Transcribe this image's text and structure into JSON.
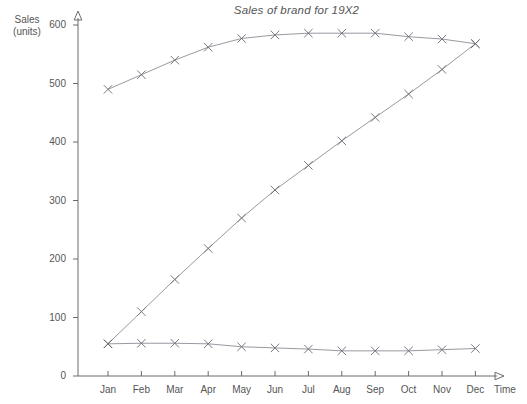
{
  "chart_data": {
    "type": "line",
    "title": "Sales of brand for 19X2",
    "xlabel": "Time",
    "ylabel": "Sales (units)",
    "ylabel_line1": "Sales",
    "ylabel_line2": "(units)",
    "categories": [
      "Jan",
      "Feb",
      "Mar",
      "Apr",
      "May",
      "Jun",
      "Jul",
      "Aug",
      "Sep",
      "Oct",
      "Nov",
      "Dec"
    ],
    "ylim": [
      0,
      600
    ],
    "yticks": [
      0,
      100,
      200,
      300,
      400,
      500,
      600
    ],
    "ytick_labels": [
      "0",
      "100",
      "200",
      "300",
      "400",
      "500",
      "600"
    ],
    "grid": false,
    "legend": "none",
    "marker": "x-cross",
    "series": [
      {
        "name": "Upper curve",
        "values": [
          490,
          515,
          540,
          562,
          577,
          583,
          586,
          586,
          586,
          580,
          576,
          568
        ]
      },
      {
        "name": "Rising curve",
        "values": [
          55,
          110,
          165,
          218,
          270,
          318,
          360,
          402,
          442,
          482,
          524,
          568
        ]
      },
      {
        "name": "Lower curve",
        "values": [
          55,
          56,
          56,
          55,
          50,
          48,
          46,
          43,
          43,
          43,
          45,
          47
        ]
      }
    ]
  },
  "axes": {
    "y_axis_name": "y-axis",
    "x_axis_name": "x-axis",
    "time_label": "Time"
  },
  "colors": {
    "axis": "#6b6b6b",
    "line": "#8d8d96",
    "marker": "#6a6a72",
    "text": "#555555",
    "background": "#ffffff"
  }
}
